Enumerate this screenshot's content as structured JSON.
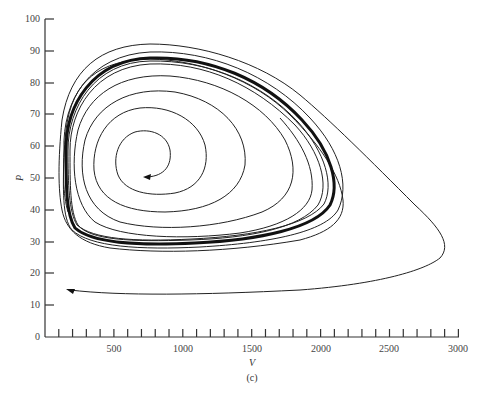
{
  "chart_data": {
    "type": "line",
    "title": "",
    "caption": "(c)",
    "xlabel": "V",
    "ylabel": "P",
    "xlim": [
      0,
      3000
    ],
    "ylim": [
      0,
      100
    ],
    "grid": false,
    "legend": null,
    "x_ticks_major": [
      500,
      1000,
      1500,
      2000,
      2500,
      3000
    ],
    "x_tick_labels": [
      "500",
      "1000",
      "1500",
      "2000",
      "2500",
      "3000"
    ],
    "x_minor_tick_step": 100,
    "y_ticks": [
      0,
      10,
      20,
      30,
      40,
      50,
      60,
      70,
      80,
      90,
      100
    ],
    "y_tick_labels": [
      "0",
      "10",
      "20",
      "30",
      "40",
      "50",
      "60",
      "70",
      "80",
      "90",
      "100"
    ],
    "series": [
      {
        "name": "limit cycle (thick)",
        "approx_points": [
          [
            170,
            50
          ],
          [
            300,
            83
          ],
          [
            700,
            88
          ],
          [
            1400,
            80
          ],
          [
            2000,
            58
          ],
          [
            2050,
            45
          ],
          [
            1700,
            33
          ],
          [
            900,
            28
          ],
          [
            300,
            30
          ],
          [
            170,
            50
          ]
        ]
      },
      {
        "name": "inner spiral (starts at center)",
        "start": [
          750,
          50
        ],
        "spirals_out_to": "limit cycle"
      },
      {
        "name": "outer trajectory",
        "start": [
          200,
          15
        ],
        "approx_points": [
          [
            200,
            15
          ],
          [
            800,
            13
          ],
          [
            2000,
            17
          ],
          [
            2800,
            25
          ],
          [
            2900,
            28
          ],
          [
            2700,
            40
          ],
          [
            2000,
            70
          ],
          [
            1200,
            88
          ],
          [
            600,
            91
          ],
          [
            250,
            80
          ],
          [
            170,
            50
          ]
        ],
        "converges_to": "limit cycle"
      }
    ],
    "annotations": [
      {
        "type": "arrow",
        "at": [
          750,
          50
        ],
        "direction": "left"
      },
      {
        "type": "arrow",
        "at": [
          180,
          15
        ],
        "direction": "left"
      }
    ]
  },
  "labels": {
    "xlabel": "V",
    "ylabel": "P",
    "caption": "(c)",
    "x_ticks": [
      "500",
      "1000",
      "1500",
      "2000",
      "2500",
      "3000"
    ],
    "y_ticks": [
      "0",
      "10",
      "20",
      "30",
      "40",
      "50",
      "60",
      "70",
      "80",
      "90",
      "100"
    ]
  }
}
